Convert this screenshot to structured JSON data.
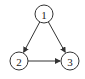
{
  "diagram": {
    "type": "directed-graph",
    "nodes": [
      {
        "id": "1",
        "label": "1",
        "cx": 44,
        "cy": 14,
        "r": 9
      },
      {
        "id": "2",
        "label": "2",
        "cx": 19,
        "cy": 61,
        "r": 9
      },
      {
        "id": "3",
        "label": "3",
        "cx": 70,
        "cy": 61,
        "r": 9
      }
    ],
    "edges": [
      {
        "from": "1",
        "to": "2"
      },
      {
        "from": "1",
        "to": "3"
      },
      {
        "from": "2",
        "to": "3"
      }
    ],
    "colors": {
      "stroke": "#333333",
      "background": "#ffffff"
    }
  }
}
